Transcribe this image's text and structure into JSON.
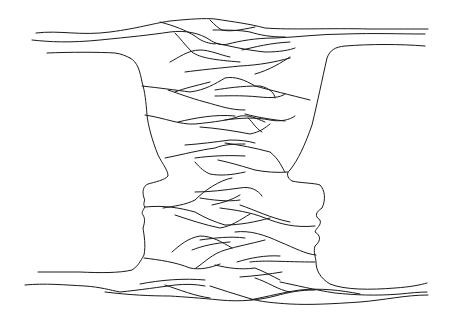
{
  "image": {
    "description": "Line drawing of a Rubin vase illusion: a vase-like shape composed of interwoven strands, whose outer contours form two facing profiles",
    "width": 453,
    "height": 325,
    "stroke_color": "#1a1a1a",
    "background_color": "#ffffff"
  }
}
